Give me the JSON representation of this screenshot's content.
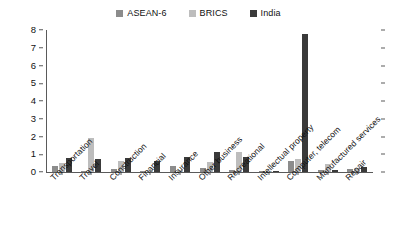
{
  "chart_data": {
    "type": "bar",
    "title": "",
    "xlabel": "",
    "ylabel": "",
    "ylim": [
      0,
      8
    ],
    "yticks": [
      0,
      1,
      2,
      3,
      4,
      5,
      6,
      7,
      8
    ],
    "grid": false,
    "legend_position": "top-center",
    "categories": [
      "Transportation",
      "Travel",
      "Construction",
      "Financial",
      "Insurance",
      "Other business",
      "Recreational",
      "Intellectual property",
      "Computer, telecom",
      "Manufactured services",
      "Repair"
    ],
    "series": [
      {
        "name": "ASEAN-6",
        "color": "#8c8c8c",
        "values": [
          0.35,
          0.06,
          0.16,
          0.05,
          0.36,
          0.25,
          0.1,
          0.05,
          0.6,
          0.1,
          0.16
        ]
      },
      {
        "name": "BRICS",
        "color": "#bdbdbd",
        "values": [
          0.52,
          1.9,
          0.6,
          0.1,
          0.12,
          0.55,
          1.15,
          0.08,
          0.75,
          0.45,
          0.22
        ]
      },
      {
        "name": "India",
        "color": "#3a3a3a",
        "values": [
          0.78,
          0.75,
          0.78,
          0.62,
          0.82,
          1.12,
          0.85,
          0.05,
          7.75,
          0.12,
          0.26
        ]
      }
    ]
  },
  "legend": {
    "items": [
      {
        "label": "ASEAN-6",
        "color": "#8c8c8c"
      },
      {
        "label": "BRICS",
        "color": "#bdbdbd"
      },
      {
        "label": "India",
        "color": "#3a3a3a"
      }
    ]
  },
  "axis": {
    "y_tick_labels": [
      "8",
      "7",
      "6",
      "5",
      "4",
      "3",
      "2",
      "1",
      "0"
    ]
  }
}
